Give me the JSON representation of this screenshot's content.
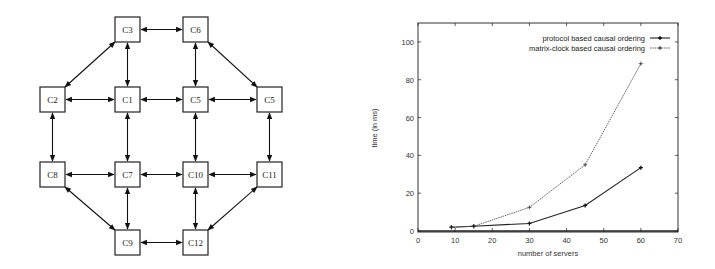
{
  "diagram": {
    "nodes": [
      {
        "id": "C3",
        "label": "C3",
        "x": 115,
        "y": 17
      },
      {
        "id": "C6",
        "label": "C6",
        "x": 183,
        "y": 17
      },
      {
        "id": "C2",
        "label": "C2",
        "x": 40,
        "y": 87
      },
      {
        "id": "C1",
        "label": "C1",
        "x": 115,
        "y": 87
      },
      {
        "id": "C5a",
        "label": "C5",
        "x": 183,
        "y": 87
      },
      {
        "id": "C5b",
        "label": "C5",
        "x": 257,
        "y": 87
      },
      {
        "id": "C8",
        "label": "C8",
        "x": 40,
        "y": 162
      },
      {
        "id": "C7",
        "label": "C7",
        "x": 115,
        "y": 162
      },
      {
        "id": "C10",
        "label": "C10",
        "x": 183,
        "y": 162
      },
      {
        "id": "C11",
        "label": "C11",
        "x": 257,
        "y": 162
      },
      {
        "id": "C9",
        "label": "C9",
        "x": 115,
        "y": 230
      },
      {
        "id": "C12",
        "label": "C12",
        "x": 183,
        "y": 230
      }
    ],
    "edges": [
      [
        "C3",
        "C6"
      ],
      [
        "C3",
        "C1"
      ],
      [
        "C6",
        "C5a"
      ],
      [
        "C3",
        "C2"
      ],
      [
        "C6",
        "C5b"
      ],
      [
        "C2",
        "C1"
      ],
      [
        "C1",
        "C5a"
      ],
      [
        "C5a",
        "C5b"
      ],
      [
        "C2",
        "C8"
      ],
      [
        "C1",
        "C7"
      ],
      [
        "C5a",
        "C10"
      ],
      [
        "C5b",
        "C11"
      ],
      [
        "C8",
        "C7"
      ],
      [
        "C7",
        "C10"
      ],
      [
        "C10",
        "C11"
      ],
      [
        "C8",
        "C9"
      ],
      [
        "C7",
        "C9"
      ],
      [
        "C10",
        "C12"
      ],
      [
        "C11",
        "C12"
      ],
      [
        "C9",
        "C12"
      ]
    ],
    "edge_style": "bidirectional-arrow"
  },
  "chart_data": {
    "type": "line",
    "title": "",
    "xlabel": "number of servers",
    "ylabel": "time (in ms)",
    "xlim": [
      0,
      70
    ],
    "ylim": [
      0,
      110
    ],
    "x_ticks": [
      0,
      10,
      20,
      30,
      40,
      50,
      60,
      70
    ],
    "y_ticks": [
      0,
      20,
      40,
      60,
      80,
      100
    ],
    "grid": false,
    "legend_position": "top-right",
    "series": [
      {
        "name": "protocol based causal ordering",
        "style": "solid",
        "x": [
          9,
          15,
          30,
          45,
          60
        ],
        "values": [
          2,
          2.5,
          4,
          13.5,
          33.5
        ]
      },
      {
        "name": "matrix-clock based causal ordering",
        "style": "dotted",
        "x": [
          9,
          15,
          30,
          45,
          60
        ],
        "values": [
          2,
          2.5,
          12.5,
          35,
          88.5
        ]
      }
    ]
  }
}
